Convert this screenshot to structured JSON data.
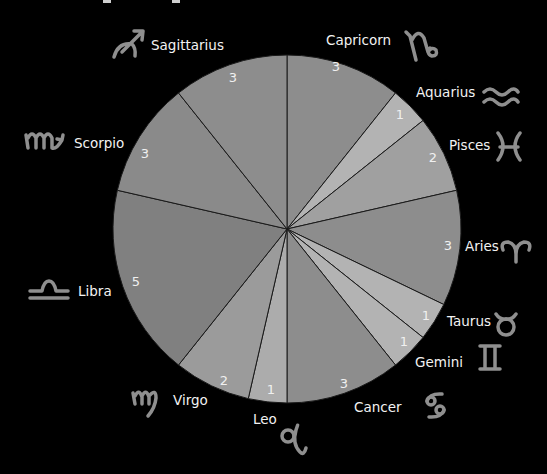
{
  "chart_data": {
    "type": "pie",
    "title": "",
    "start_angle": "12 o'clock, clockwise",
    "total": 28,
    "categories": [
      "Capricorn",
      "Aquarius",
      "Pisces",
      "Aries",
      "Taurus",
      "Gemini",
      "Cancer",
      "Leo",
      "Virgo",
      "Libra",
      "Scorpio",
      "Sagittarius"
    ],
    "values": [
      3,
      1,
      2,
      3,
      1,
      1,
      3,
      1,
      2,
      5,
      3,
      3
    ],
    "symbols": [
      "♑",
      "♒",
      "♓",
      "♈",
      "♉",
      "♊",
      "♋",
      "♌",
      "♍",
      "♎",
      "♏",
      "♐"
    ],
    "colors": [
      "#8d8d8d",
      "#b3b3b3",
      "#a0a0a0",
      "#8d8d8d",
      "#b3b3b3",
      "#b3b3b3",
      "#8d8d8d",
      "#acacac",
      "#9b9b9b",
      "#808080",
      "#8a8a8a",
      "#8d8d8d"
    ],
    "legend": "none (labels placed outside slices with zodiac glyphs)"
  },
  "labels": {
    "capricorn": "Capricorn",
    "aquarius": "Aquarius",
    "pisces": "Pisces",
    "aries": "Aries",
    "taurus": "Taurus",
    "gemini": "Gemini",
    "cancer": "Cancer",
    "leo": "Leo",
    "virgo": "Virgo",
    "libra": "Libra",
    "scorpio": "Scorpio",
    "sagittarius": "Sagittarius"
  },
  "values": {
    "capricorn": "3",
    "aquarius": "1",
    "pisces": "2",
    "aries": "3",
    "taurus": "1",
    "gemini": "1",
    "cancer": "3",
    "leo": "1",
    "virgo": "2",
    "libra": "5",
    "scorpio": "3",
    "sagittarius": "3"
  },
  "glyphs": {
    "capricorn": "♑",
    "aquarius": "♒",
    "pisces": "♓",
    "aries": "♈",
    "taurus": "♉",
    "gemini": "♊",
    "cancer": "♋",
    "leo": "♌",
    "virgo": "♍",
    "libra": "♎",
    "scorpio": "♏",
    "sagittarius": "♐"
  }
}
